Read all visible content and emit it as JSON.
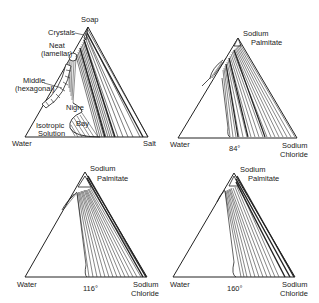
{
  "panels": [
    {
      "id": "generic",
      "apex_label": "Soap",
      "left_label": "Water",
      "right_label": "Salt",
      "temperature": "",
      "regions": {
        "crystals": "Crystals",
        "neat_1": "Neat",
        "neat_2": "(lamellar)",
        "middle_1": "Middle",
        "middle_2": "(hexagonal)",
        "nigre": "Nigre",
        "bay": "Bay",
        "iso_1": "Isotropic",
        "iso_2": "Solution"
      }
    },
    {
      "id": "84",
      "apex_label_1": "Sodium",
      "apex_label_2": "Palmitate",
      "left_label": "Water",
      "right_label_1": "Sodium",
      "right_label_2": "Chloride",
      "temperature": "84°"
    },
    {
      "id": "116",
      "apex_label_1": "Sodium",
      "apex_label_2": "Palmitate",
      "left_label": "Water",
      "right_label_1": "Sodium",
      "right_label_2": "Chloride",
      "temperature": "116°"
    },
    {
      "id": "160",
      "apex_label_1": "Sodium",
      "apex_label_2": "Palmitate",
      "left_label": "Water",
      "right_label_1": "Sodium",
      "right_label_2": "Chloride",
      "temperature": "160°"
    }
  ]
}
